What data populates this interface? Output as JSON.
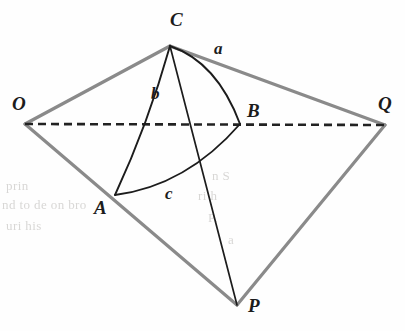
{
  "figure": {
    "type": "geometry-diagram",
    "background_color": "#fefefe",
    "edge_color": "#8a8a8a",
    "arc_color": "#1c1c1c",
    "dashed_color": "#222222",
    "vertices": [
      {
        "id": "O",
        "label": "O",
        "x": 25,
        "y": 124,
        "label_x": 12,
        "label_y": 110
      },
      {
        "id": "C",
        "label": "C",
        "x": 170,
        "y": 46,
        "label_x": 170,
        "label_y": 26
      },
      {
        "id": "Q",
        "label": "Q",
        "x": 385,
        "y": 125,
        "label_x": 378,
        "label_y": 110
      },
      {
        "id": "P",
        "label": "P",
        "x": 237,
        "y": 305,
        "label_x": 248,
        "label_y": 312
      },
      {
        "id": "A",
        "label": "A",
        "x": 115,
        "y": 195,
        "label_x": 94,
        "label_y": 214
      },
      {
        "id": "B",
        "label": "B",
        "x": 240,
        "y": 124,
        "label_x": 247,
        "label_y": 117
      }
    ],
    "straight_edges": [
      {
        "name": "edge-O-C",
        "from": "O",
        "to": "C",
        "style": "solid-gray"
      },
      {
        "name": "edge-C-Q",
        "from": "C",
        "to": "Q",
        "style": "solid-gray"
      },
      {
        "name": "edge-O-P",
        "from": "O",
        "to": "P",
        "style": "solid-gray"
      },
      {
        "name": "edge-P-Q",
        "from": "P",
        "to": "Q",
        "style": "solid-gray"
      },
      {
        "name": "edge-C-P",
        "from": "C",
        "to": "P",
        "style": "solid-black"
      }
    ],
    "dashed_edges": [
      {
        "name": "axis-O-Q",
        "from": "O",
        "to": "Q",
        "dash": "8 5"
      }
    ],
    "arcs": [
      {
        "name": "arc-C-B",
        "from": "C",
        "to": "B",
        "bulge": "right",
        "side_label": "a"
      },
      {
        "name": "arc-C-A",
        "from": "C",
        "to": "A",
        "bulge": "left",
        "side_label": "b"
      },
      {
        "name": "arc-A-B",
        "from": "A",
        "to": "B",
        "bulge": "down",
        "side_label": "c"
      }
    ],
    "side_labels": [
      {
        "id": "a",
        "label": "a",
        "x": 214,
        "y": 54
      },
      {
        "id": "b",
        "label": "b",
        "x": 151,
        "y": 99
      },
      {
        "id": "c",
        "label": "c",
        "x": 165,
        "y": 199
      }
    ],
    "ghost_text": [
      {
        "text": "prin   ",
        "x": 6,
        "y": 186
      },
      {
        "text": "nd to de    on bro",
        "x": 2,
        "y": 205
      },
      {
        "text": "uri      his",
        "x": 6,
        "y": 226
      },
      {
        "text": "n          S",
        "x": 210,
        "y": 176
      },
      {
        "text": "ri       h",
        "x": 196,
        "y": 196
      },
      {
        "text": "P.",
        "x": 206,
        "y": 218
      },
      {
        "text": "a",
        "x": 226,
        "y": 240
      }
    ]
  }
}
